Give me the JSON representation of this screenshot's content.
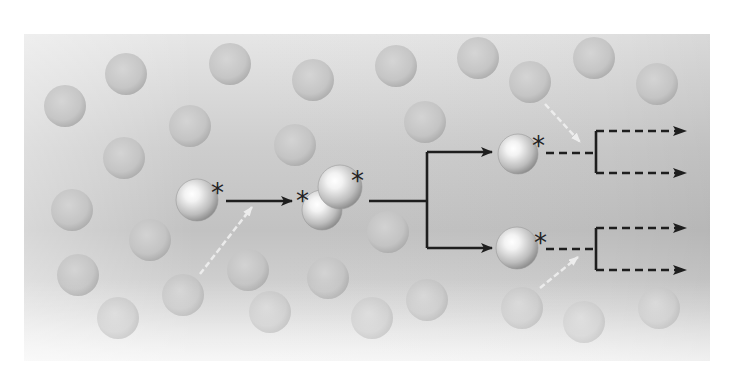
{
  "diagram": {
    "type": "branching-chain-reaction",
    "panel": {
      "x": 24,
      "y": 34,
      "width": 686,
      "height": 327
    },
    "colors": {
      "panel_light": "#ececec",
      "panel_mid": "#c9c9c9",
      "panel_band": "#b9b9b9",
      "background_sphere": "#c4c4c4",
      "background_sphere_edge": "#a9a9a9",
      "active_sphere_highlight": "#ffffff",
      "active_sphere_shade": "#8e8e8e",
      "arrow": "#1e1e1e",
      "faint_arrow": "#f2f2f2"
    },
    "activation_marker": "*",
    "background_spheres": [
      {
        "cx": 126,
        "cy": 74
      },
      {
        "cx": 65,
        "cy": 106
      },
      {
        "cx": 230,
        "cy": 64
      },
      {
        "cx": 190,
        "cy": 126
      },
      {
        "cx": 124,
        "cy": 158
      },
      {
        "cx": 313,
        "cy": 80
      },
      {
        "cx": 396,
        "cy": 66
      },
      {
        "cx": 295,
        "cy": 145
      },
      {
        "cx": 425,
        "cy": 122
      },
      {
        "cx": 478,
        "cy": 58
      },
      {
        "cx": 530,
        "cy": 82
      },
      {
        "cx": 594,
        "cy": 58
      },
      {
        "cx": 657,
        "cy": 84
      },
      {
        "cx": 72,
        "cy": 210
      },
      {
        "cx": 150,
        "cy": 240
      },
      {
        "cx": 78,
        "cy": 275
      },
      {
        "cx": 118,
        "cy": 318
      },
      {
        "cx": 183,
        "cy": 295
      },
      {
        "cx": 248,
        "cy": 270
      },
      {
        "cx": 270,
        "cy": 312
      },
      {
        "cx": 328,
        "cy": 278
      },
      {
        "cx": 372,
        "cy": 318
      },
      {
        "cx": 427,
        "cy": 300
      },
      {
        "cx": 388,
        "cy": 232
      },
      {
        "cx": 522,
        "cy": 308
      },
      {
        "cx": 584,
        "cy": 322
      },
      {
        "cx": 659,
        "cy": 308
      }
    ],
    "active_species": [
      {
        "id": "initiator",
        "spheres": [
          {
            "cx": 197,
            "cy": 200,
            "r": 21
          }
        ],
        "stars": [
          {
            "x": 211,
            "y": 194
          }
        ]
      },
      {
        "id": "collision-pair",
        "spheres": [
          {
            "cx": 322,
            "cy": 210,
            "r": 20
          },
          {
            "cx": 340,
            "cy": 187,
            "r": 22
          }
        ],
        "stars": [
          {
            "x": 296,
            "y": 202
          },
          {
            "x": 351,
            "y": 182
          }
        ]
      },
      {
        "id": "branch-upper",
        "spheres": [
          {
            "cx": 518,
            "cy": 154,
            "r": 20
          }
        ],
        "stars": [
          {
            "x": 532,
            "y": 147
          }
        ]
      },
      {
        "id": "branch-lower",
        "spheres": [
          {
            "cx": 517,
            "cy": 248,
            "r": 21
          }
        ],
        "stars": [
          {
            "x": 534,
            "y": 244
          }
        ]
      }
    ],
    "solid_arrows": [
      {
        "id": "step-1",
        "points": [
          [
            226,
            201
          ],
          [
            292,
            201
          ]
        ],
        "head": true
      },
      {
        "id": "trunk",
        "points": [
          [
            369,
            201
          ],
          [
            427,
            201
          ]
        ],
        "head": false
      },
      {
        "id": "fork-vertical",
        "points": [
          [
            427,
            152
          ],
          [
            427,
            248
          ]
        ],
        "head": false
      },
      {
        "id": "fork-upper",
        "points": [
          [
            427,
            152
          ],
          [
            492,
            152
          ]
        ],
        "head": true
      },
      {
        "id": "fork-lower",
        "points": [
          [
            427,
            248
          ],
          [
            492,
            248
          ]
        ],
        "head": true
      }
    ],
    "dashed_arrows": [
      {
        "id": "upper-stem",
        "points": [
          [
            546,
            153
          ],
          [
            596,
            153
          ]
        ],
        "head": false
      },
      {
        "id": "upper-bracket",
        "points": [
          [
            596,
            131
          ],
          [
            596,
            173
          ]
        ],
        "head": false,
        "solid": true
      },
      {
        "id": "upper-out-1",
        "points": [
          [
            596,
            131
          ],
          [
            686,
            131
          ]
        ],
        "head": true
      },
      {
        "id": "upper-out-2",
        "points": [
          [
            596,
            173
          ],
          [
            686,
            173
          ]
        ],
        "head": true
      },
      {
        "id": "lower-stem",
        "points": [
          [
            546,
            249
          ],
          [
            596,
            249
          ]
        ],
        "head": false
      },
      {
        "id": "lower-bracket",
        "points": [
          [
            596,
            228
          ],
          [
            596,
            270
          ]
        ],
        "head": false,
        "solid": true
      },
      {
        "id": "lower-out-1",
        "points": [
          [
            596,
            228
          ],
          [
            686,
            228
          ]
        ],
        "head": true
      },
      {
        "id": "lower-out-2",
        "points": [
          [
            596,
            270
          ],
          [
            686,
            270
          ]
        ],
        "head": true
      }
    ],
    "faint_arrows": [
      {
        "id": "incoming-1",
        "from": [
          200,
          274
        ],
        "to": [
          252,
          207
        ]
      },
      {
        "id": "incoming-upper",
        "from": [
          545,
          104
        ],
        "to": [
          580,
          142
        ]
      },
      {
        "id": "incoming-lower",
        "from": [
          540,
          288
        ],
        "to": [
          578,
          257
        ]
      }
    ]
  }
}
